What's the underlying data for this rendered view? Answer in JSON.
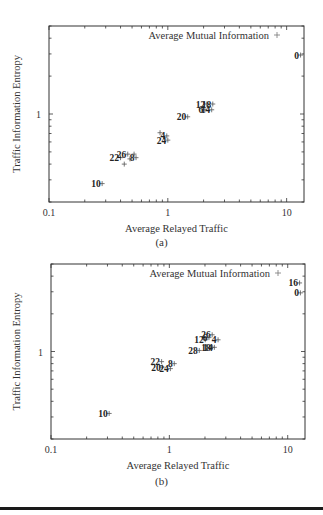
{
  "chart_data": [
    {
      "type": "scatter",
      "panel_label": "(a)",
      "title": "",
      "xlabel": "Average Relayed Traffic",
      "ylabel": "Traffic Information Entropy",
      "xscale": "log",
      "yscale": "log",
      "xlim": [
        0.1,
        14
      ],
      "ylim": [
        0.2,
        5
      ],
      "x_tick_labels": [
        "0.1",
        "1",
        "10"
      ],
      "y_tick_labels": [
        "1"
      ],
      "grid": false,
      "legend": {
        "entries": [
          "Average Mutual Information"
        ],
        "marker": "+",
        "position": "top-right"
      },
      "series": [
        {
          "name": "Average Mutual Information",
          "points": [
            {
              "label": "0",
              "x": 13.1,
              "y": 2.94
            },
            {
              "label": "12",
              "x": 2.13,
              "y": 1.2
            },
            {
              "label": "18",
              "x": 2.39,
              "y": 1.2
            },
            {
              "label": "6",
              "x": 2.05,
              "y": 1.08
            },
            {
              "label": "14",
              "x": 2.34,
              "y": 1.08
            },
            {
              "label": "20",
              "x": 1.47,
              "y": 0.95
            },
            {
              "label": "4",
              "x": 0.98,
              "y": 0.67
            },
            {
              "label": "24",
              "x": 1.0,
              "y": 0.62
            },
            {
              "label": "22",
              "x": 0.4,
              "y": 0.45
            },
            {
              "label": "26",
              "x": 0.46,
              "y": 0.48
            },
            {
              "label": "8",
              "x": 0.54,
              "y": 0.45
            },
            {
              "label": "10",
              "x": 0.28,
              "y": 0.28
            },
            {
              "label": "",
              "x": 0.86,
              "y": 0.71
            },
            {
              "label": "",
              "x": 0.48,
              "y": 0.44
            },
            {
              "label": "",
              "x": 0.43,
              "y": 0.4
            },
            {
              "label": "",
              "x": 0.52,
              "y": 0.48
            }
          ]
        }
      ]
    },
    {
      "type": "scatter",
      "panel_label": "(b)",
      "title": "",
      "xlabel": "Average Relayed Traffic",
      "ylabel": "Traffic Information Entropy",
      "xscale": "log",
      "yscale": "log",
      "xlim": [
        0.1,
        14
      ],
      "ylim": [
        0.2,
        5
      ],
      "x_tick_labels": [
        "0.1",
        "1",
        "10"
      ],
      "y_tick_labels": [
        "1"
      ],
      "grid": false,
      "legend": {
        "entries": [
          "Average Mutual Information"
        ],
        "marker": "+",
        "position": "top-right"
      },
      "series": [
        {
          "name": "Average Mutual Information",
          "points": [
            {
              "label": "16",
              "x": 12.6,
              "y": 3.53
            },
            {
              "label": "0",
              "x": 12.8,
              "y": 2.94
            },
            {
              "label": "12",
              "x": 2.01,
              "y": 1.24
            },
            {
              "label": "26",
              "x": 2.3,
              "y": 1.36
            },
            {
              "label": "6",
              "x": 2.16,
              "y": 1.29
            },
            {
              "label": "4",
              "x": 2.58,
              "y": 1.24
            },
            {
              "label": "28",
              "x": 1.79,
              "y": 1.02
            },
            {
              "label": "18",
              "x": 2.3,
              "y": 1.08
            },
            {
              "label": "14",
              "x": 2.4,
              "y": 1.08
            },
            {
              "label": "22",
              "x": 0.86,
              "y": 0.83
            },
            {
              "label": "20",
              "x": 0.87,
              "y": 0.75
            },
            {
              "label": "24",
              "x": 1.02,
              "y": 0.73
            },
            {
              "label": "8",
              "x": 1.1,
              "y": 0.8
            },
            {
              "label": "10",
              "x": 0.31,
              "y": 0.32
            }
          ]
        }
      ]
    }
  ],
  "figure": {
    "panels": [
      {
        "caption": "(a)",
        "xlabel": "Average Relayed Traffic",
        "ylabel": "Traffic Information Entropy",
        "legend_label": "Average Mutual Information",
        "x_ticks": [
          "0.1",
          "1",
          "10"
        ],
        "y_ticks": [
          "1"
        ]
      },
      {
        "caption": "(b)",
        "xlabel": "Average Relayed Traffic",
        "ylabel": "Traffic Information Entropy",
        "legend_label": "Average Mutual Information",
        "x_ticks": [
          "0.1",
          "1",
          "10"
        ],
        "y_ticks": [
          "1"
        ]
      }
    ]
  }
}
